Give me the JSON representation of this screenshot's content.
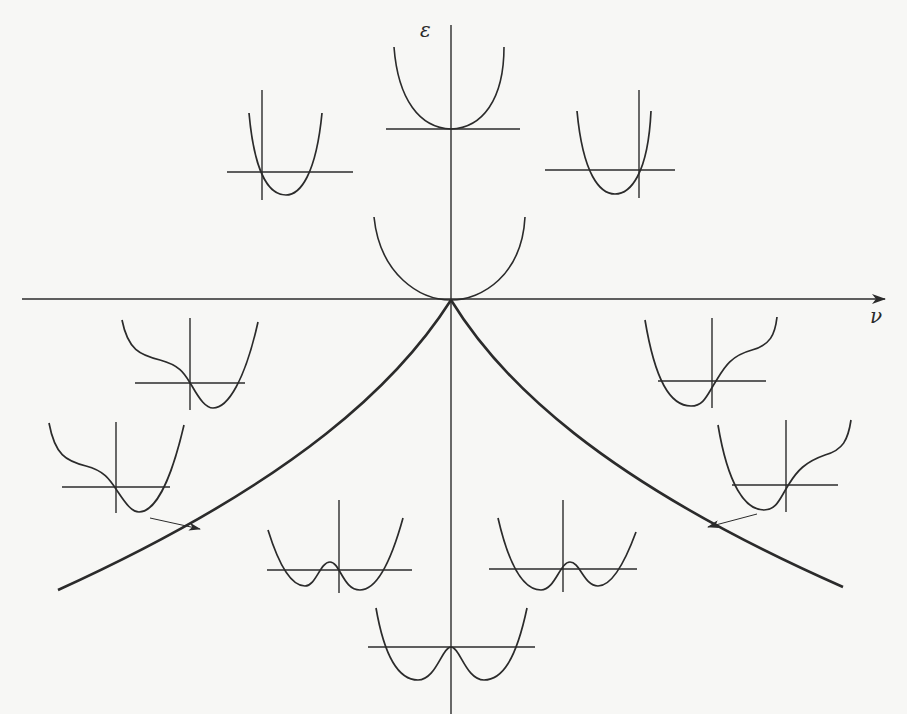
{
  "figure": {
    "type": "cusp-catastrophe-bifurcation-diagram",
    "axes": {
      "vertical_label": "ε",
      "horizontal_label": "ν"
    },
    "curve": {
      "name": "bifurcation-set",
      "shape": "cusp",
      "apex": "origin"
    },
    "insets": [
      {
        "position": "top-center",
        "shape": "single-well",
        "description": "quartic with single minimum at origin"
      },
      {
        "position": "upper-left",
        "shape": "single-well-shifted-right",
        "description": "parabola minimum to right of axis"
      },
      {
        "position": "upper-right",
        "shape": "single-well-shifted-left",
        "description": "parabola minimum to left of axis"
      },
      {
        "position": "center-above-origin",
        "shape": "flat-bottom-well",
        "description": "well touching origin"
      },
      {
        "position": "left-upper",
        "shape": "well-with-inflection-left",
        "description": "single minimum with shoulder on left"
      },
      {
        "position": "left-lower",
        "shape": "well-with-inflection-left",
        "description": "single minimum with shoulder, marked by arrow to curve"
      },
      {
        "position": "right-upper",
        "shape": "well-with-inflection-right",
        "description": "single minimum with shoulder on right"
      },
      {
        "position": "right-lower",
        "shape": "well-with-inflection-right",
        "description": "single minimum with shoulder, marked by arrow to curve"
      },
      {
        "position": "lower-left",
        "shape": "asymmetric-double-well",
        "description": "double well, deeper right"
      },
      {
        "position": "lower-right",
        "shape": "asymmetric-double-well",
        "description": "double well, deeper left"
      },
      {
        "position": "bottom-center",
        "shape": "symmetric-double-well",
        "description": "symmetric double well"
      }
    ],
    "arrows": [
      {
        "from": "left-lower-inset",
        "to": "left-branch-of-cusp"
      },
      {
        "from": "right-lower-inset",
        "to": "right-branch-of-cusp"
      }
    ]
  }
}
